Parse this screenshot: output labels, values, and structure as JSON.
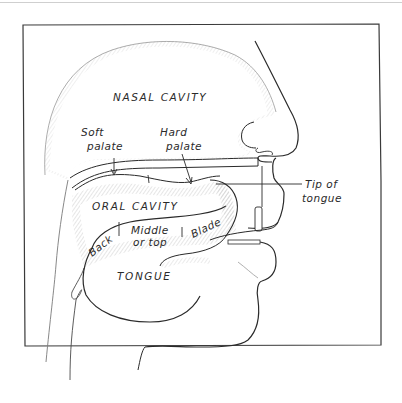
{
  "diagram": {
    "type": "anatomical-cross-section",
    "labels": {
      "nasal_cavity": "NASAL CAVITY",
      "soft_palate_1": "Soft",
      "soft_palate_2": "palate",
      "hard_palate_1": "Hard",
      "hard_palate_2": "palate",
      "oral_cavity": "ORAL CAVITY",
      "tip_1": "Tip of",
      "tip_2": "tongue",
      "back": "Back",
      "middle_1": "Middle",
      "middle_2": "or top",
      "blade": "Blade",
      "tongue": "TONGUE"
    },
    "colors": {
      "ink": "#2a2a2a",
      "shade": "#bdbdbd",
      "frame": "#3a3a3a",
      "background": "#ffffff"
    }
  }
}
